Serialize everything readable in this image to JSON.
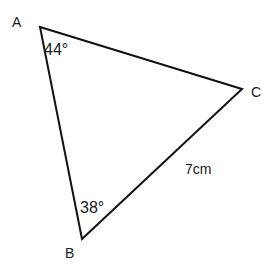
{
  "diagram": {
    "type": "triangle",
    "stroke_color": "#111111",
    "vertices": {
      "A": {
        "label": "A",
        "x": 40,
        "y": 27
      },
      "B": {
        "label": "B",
        "x": 82,
        "y": 239
      },
      "C": {
        "label": "C",
        "x": 242,
        "y": 89
      }
    },
    "angles": {
      "A": "44°",
      "B": "38°"
    },
    "sides": {
      "BC": "7cm"
    }
  }
}
